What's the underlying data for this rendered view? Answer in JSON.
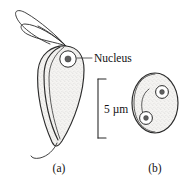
{
  "figure": {
    "background_color": "#ffffff",
    "ink_color": "#2b2b2b",
    "text_color": "#121212",
    "cytoplasm_fill": "#f4f3f1",
    "stipple_color": "#9a9a9a",
    "karyosome_color": "#5f5f5f"
  },
  "annotations": {
    "nucleus_label": "Nucleus",
    "scale_label": "5 µm"
  },
  "panels": [
    {
      "id": "a",
      "label": "(a)",
      "description": "trophozoite",
      "features": [
        "anterior flagella",
        "teardrop body",
        "nucleus with karyosome",
        "posterior flagellum"
      ]
    },
    {
      "id": "b",
      "label": "(b)",
      "description": "cyst",
      "features": [
        "oval wall",
        "two nuclei",
        "internal curved fibril"
      ]
    }
  ],
  "scale_bar": {
    "value": "5",
    "unit": "µm",
    "text": "5 µm",
    "orientation": "vertical"
  }
}
